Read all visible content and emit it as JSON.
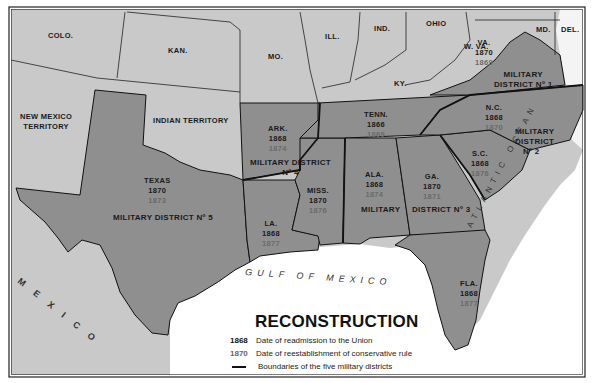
{
  "map": {
    "title": "RECONSTRUCTION",
    "colors": {
      "non_confederate_land": "#c8c8c8",
      "confederate_states": "#8e8e8e",
      "water": "#ffffff",
      "border": "#111111"
    },
    "non_confederate_labels": {
      "colo": "COLO.",
      "kan": "KAN.",
      "mo": "MO.",
      "ill": "ILL.",
      "ind": "IND.",
      "ohio": "OHIO",
      "w_va": "W. VA.",
      "md": "MD.",
      "del": "DEL.",
      "ky": "KY.",
      "new_mexico_1": "NEW MEXICO",
      "new_mexico_2": "TERRITORY",
      "indian_territory": "INDIAN TERRITORY"
    },
    "states": {
      "va": {
        "name": "VA.",
        "readmitted": "1870",
        "conservative_rule": "1869"
      },
      "nc": {
        "name": "N.C.",
        "readmitted": "1868",
        "conservative_rule": "1870"
      },
      "tenn": {
        "name": "TENN.",
        "readmitted": "1866",
        "conservative_rule": "1869"
      },
      "ark": {
        "name": "ARK.",
        "readmitted": "1868",
        "conservative_rule": "1874"
      },
      "sc": {
        "name": "S.C.",
        "readmitted": "1868",
        "conservative_rule": "1876"
      },
      "texas": {
        "name": "TEXAS",
        "readmitted": "1870",
        "conservative_rule": "1873"
      },
      "miss": {
        "name": "MISS.",
        "readmitted": "1870",
        "conservative_rule": "1876"
      },
      "ala": {
        "name": "ALA.",
        "readmitted": "1868",
        "conservative_rule": "1874"
      },
      "ga": {
        "name": "GA.",
        "readmitted": "1870",
        "conservative_rule": "1871"
      },
      "la": {
        "name": "LA.",
        "readmitted": "1868",
        "conservative_rule": "1877"
      },
      "fla": {
        "name": "FLA.",
        "readmitted": "1868",
        "conservative_rule": "1877"
      }
    },
    "districts": {
      "d1_a": "MILITARY",
      "d1_b": "DISTRICT Nº 1",
      "d2_a": "MILITARY",
      "d2_b": "DISTRICT",
      "d2_c": "Nº 2",
      "d3_a": "MILITARY",
      "d3_b": "DISTRICT Nº 3",
      "d4_a": "MILITARY DISTRICT",
      "d4_b": "Nº 4",
      "d5": "MILITARY DISTRICT Nº 5"
    },
    "water_labels": {
      "gulf": "GULF OF MEXICO",
      "atlantic": "ATLANTIC OCEAN",
      "mexico": "MEXICO"
    },
    "legend": {
      "items": [
        {
          "key": "1868",
          "text": "Date of readmission to the Union"
        },
        {
          "key": "1870",
          "text": "Date of reestablishment of conservative rule"
        },
        {
          "key": "",
          "text": "Boundaries of the five military districts"
        }
      ]
    }
  }
}
